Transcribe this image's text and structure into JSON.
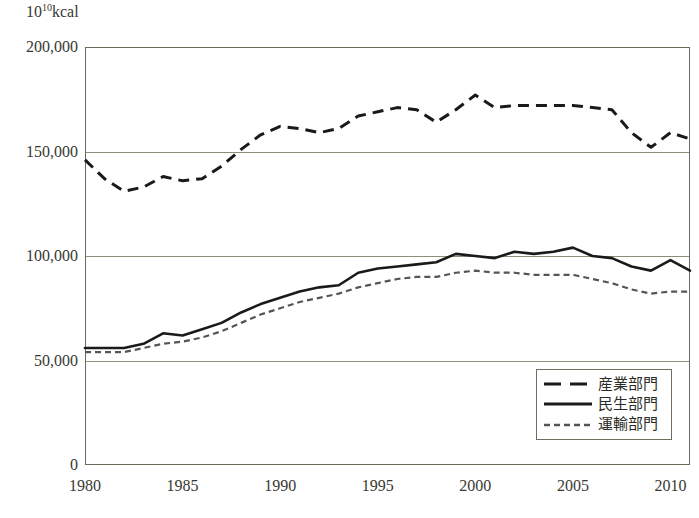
{
  "chart_data": {
    "type": "line",
    "title": "",
    "xlabel": "",
    "ylabel": "10^10 kcal",
    "ylabel_mantissa": "10",
    "ylabel_exponent": "10",
    "ylabel_unit": "kcal",
    "xlim": [
      1980,
      2011
    ],
    "ylim": [
      0,
      200000
    ],
    "yticks": [
      0,
      50000,
      100000,
      150000,
      200000
    ],
    "ytick_labels": [
      "0",
      "50,000",
      "100,000",
      "150,000",
      "200,000"
    ],
    "xticks": [
      1980,
      1985,
      1990,
      1995,
      2000,
      2005,
      2010
    ],
    "xtick_labels": [
      "1980",
      "1985",
      "1990",
      "1995",
      "2000",
      "2005",
      "2010"
    ],
    "grid": "horizontal",
    "legend_position": "bottom-right",
    "x": [
      1980,
      1981,
      1982,
      1983,
      1984,
      1985,
      1986,
      1987,
      1988,
      1989,
      1990,
      1991,
      1992,
      1993,
      1994,
      1995,
      1996,
      1997,
      1998,
      1999,
      2000,
      2001,
      2002,
      2003,
      2004,
      2005,
      2006,
      2007,
      2008,
      2009,
      2010,
      2011
    ],
    "series": [
      {
        "name": "産業部門",
        "style": "dashed",
        "color": "#1a1a1a",
        "values": [
          146000,
          137000,
          131000,
          133000,
          138000,
          136000,
          137000,
          143000,
          151000,
          158000,
          162000,
          161000,
          159000,
          161000,
          167000,
          169000,
          171000,
          170000,
          164000,
          170000,
          177000,
          171000,
          172000,
          172000,
          172000,
          172000,
          171000,
          170000,
          159000,
          152000,
          159000,
          156000
        ]
      },
      {
        "name": "民生部門",
        "style": "solid",
        "color": "#1a1a1a",
        "values": [
          56000,
          56000,
          56000,
          58000,
          63000,
          62000,
          65000,
          68000,
          73000,
          77000,
          80000,
          83000,
          85000,
          86000,
          92000,
          94000,
          95000,
          96000,
          97000,
          101000,
          100000,
          99000,
          102000,
          101000,
          102000,
          104000,
          100000,
          99000,
          95000,
          93000,
          98000,
          93000
        ]
      },
      {
        "name": "運輸部門",
        "style": "dotted",
        "color": "#555555",
        "values": [
          54000,
          54000,
          54000,
          56000,
          58000,
          59000,
          61000,
          64000,
          68000,
          72000,
          75000,
          78000,
          80000,
          82000,
          85000,
          87000,
          89000,
          90000,
          90000,
          92000,
          93000,
          92000,
          92000,
          91000,
          91000,
          91000,
          89000,
          87000,
          84000,
          82000,
          83000,
          83000
        ]
      }
    ]
  },
  "legend": {
    "items": [
      {
        "label": "産業部門",
        "style": "dashed"
      },
      {
        "label": "民生部門",
        "style": "solid"
      },
      {
        "label": "運輸部門",
        "style": "dotted"
      }
    ]
  }
}
